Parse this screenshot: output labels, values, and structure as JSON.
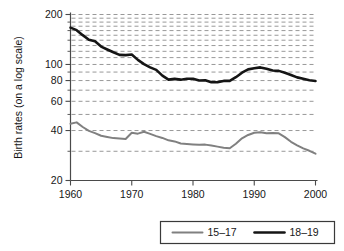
{
  "chart_data": {
    "type": "line",
    "title": "",
    "xlabel": "",
    "ylabel": "Birth rates (on a log scale)",
    "yscale": "log",
    "xlim": [
      1960,
      2000
    ],
    "ylim": [
      20,
      200
    ],
    "grid": true,
    "grid_axis": "y",
    "legend_position": "below-center",
    "x_ticks": [
      1960,
      1970,
      1980,
      1990,
      2000
    ],
    "x_tick_labels": [
      "1960",
      "1970",
      "1980",
      "1990",
      "2000"
    ],
    "y_ticks": [
      20,
      40,
      60,
      80,
      100,
      200
    ],
    "y_tick_labels": [
      "20",
      "40",
      "60",
      "80",
      "100",
      "200"
    ],
    "y_gridlines": [
      30,
      40,
      50,
      60,
      70,
      80,
      90,
      100,
      110,
      120,
      130,
      140,
      150,
      160,
      170,
      180,
      190,
      200
    ],
    "x": [
      1960,
      1961,
      1962,
      1963,
      1964,
      1965,
      1966,
      1967,
      1968,
      1969,
      1970,
      1971,
      1972,
      1973,
      1974,
      1975,
      1976,
      1977,
      1978,
      1979,
      1980,
      1981,
      1982,
      1983,
      1984,
      1985,
      1986,
      1987,
      1988,
      1989,
      1990,
      1991,
      1992,
      1993,
      1994,
      1995,
      1996,
      1997,
      1998,
      1999,
      2000
    ],
    "series": [
      {
        "name": "15–17",
        "color": "#808080",
        "linewidth": 2.0,
        "values": [
          43.9,
          44.8,
          42.0,
          39.8,
          38.6,
          37.2,
          36.6,
          36.0,
          35.8,
          35.6,
          38.8,
          38.3,
          39.3,
          38.2,
          37.0,
          36.1,
          34.9,
          34.4,
          33.4,
          33.2,
          33.0,
          32.8,
          32.9,
          32.5,
          32.0,
          31.5,
          31.3,
          33.3,
          35.9,
          37.6,
          38.8,
          39.1,
          38.5,
          38.6,
          38.5,
          36.5,
          34.2,
          32.6,
          31.2,
          30.2,
          29.0
        ]
      },
      {
        "name": "18–19",
        "color": "#151515",
        "linewidth": 2.6,
        "values": [
          166.7,
          161.0,
          150.2,
          141.0,
          137.9,
          128.2,
          123.1,
          118.4,
          114.3,
          113.8,
          114.7,
          106.6,
          100.5,
          96.0,
          92.8,
          85.7,
          81.0,
          81.9,
          81.0,
          82.1,
          82.1,
          80.0,
          80.3,
          78.1,
          78.3,
          79.6,
          79.6,
          83.8,
          89.2,
          93.4,
          94.8,
          96.0,
          94.3,
          92.0,
          91.5,
          89.1,
          86.5,
          83.6,
          82.0,
          80.3,
          79.5
        ]
      }
    ]
  },
  "legend": {
    "items": [
      {
        "label": "15–17",
        "color": "#808080"
      },
      {
        "label": "18–19",
        "color": "#151515"
      }
    ]
  }
}
